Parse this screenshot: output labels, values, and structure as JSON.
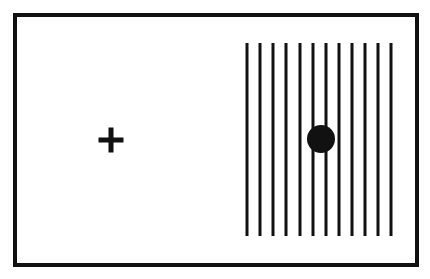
{
  "figure": {
    "width": 430,
    "height": 279,
    "colors": {
      "background": "#ffffff",
      "ink": "#111111"
    },
    "frame": {
      "x": 13,
      "y": 13,
      "width": 406,
      "height": 254,
      "stroke": 4
    },
    "fixation_cross": {
      "cx": 111,
      "cy": 140,
      "arm_length": 25,
      "thickness": 5
    },
    "grating": {
      "orientation": "vertical",
      "line_count": 12,
      "x_positions": [
        247,
        260,
        273,
        286,
        300,
        313,
        326,
        339,
        352,
        365,
        378,
        391
      ],
      "y_top": 43,
      "y_bottom": 236,
      "line_width": 3
    },
    "target_dot": {
      "cx": 321,
      "cy": 139,
      "r": 14
    }
  }
}
